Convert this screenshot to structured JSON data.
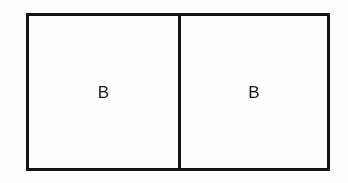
{
  "figure": {
    "name": "two-cell-rectangle-diagram",
    "background_color": "#ffffff",
    "line_color": "#131313",
    "border_width_px": 3,
    "outer_rectangle": {
      "x": 26,
      "y": 13,
      "width": 304,
      "height": 158
    },
    "divider": {
      "orientation": "vertical",
      "x": 178,
      "width_px": 3
    },
    "cells": [
      {
        "id": "cell-left",
        "label": "B",
        "width": 149,
        "label_x": 103,
        "label_y": 93
      },
      {
        "id": "cell-right",
        "label": "B",
        "width": 149,
        "label_x": 253,
        "label_y": 93
      }
    ]
  }
}
